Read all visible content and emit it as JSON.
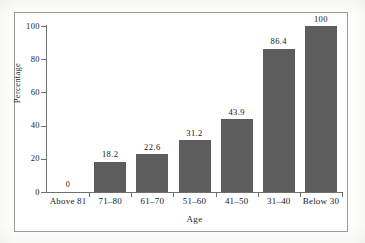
{
  "figure": {
    "frame": true,
    "background_color": "#ffffff",
    "bar_color": "#5d5d5d",
    "axis_color": "#6f6f6c",
    "text_color": "#1b1b1b"
  },
  "chart_data": {
    "type": "bar",
    "title": "",
    "subtitle": "",
    "xlabel": "Age",
    "ylabel": "Percentage",
    "categories": [
      "Above 81",
      "71–80",
      "61–70",
      "51–60",
      "41–50",
      "31–40",
      "Below 30"
    ],
    "values": [
      0,
      18.2,
      22.6,
      31.2,
      43.9,
      86.4,
      100
    ],
    "value_labels": [
      "0",
      "18.2",
      "22.6",
      "31.2",
      "43.9",
      "86.4",
      "100"
    ],
    "ylim": [
      0,
      100
    ],
    "xlim_categories": 7,
    "yticks": [
      0,
      20,
      40,
      60,
      80,
      100
    ],
    "ytick_labels": [
      "0",
      "20",
      "40",
      "60",
      "80",
      "100"
    ],
    "grid": false,
    "legend": false,
    "legend_position": "none",
    "annotations": [
      {
        "category": "Above 81",
        "text": "0",
        "note": "zero-value label shown above baseline; no bar drawn"
      }
    ]
  }
}
